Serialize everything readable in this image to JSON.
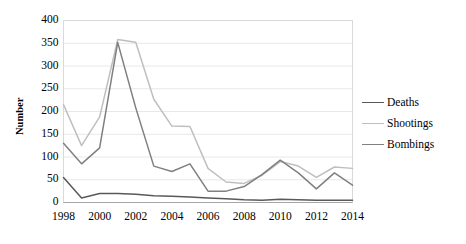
{
  "chart_data": {
    "type": "line",
    "title": "",
    "xlabel": "",
    "ylabel": "Number",
    "ylim": [
      0,
      400
    ],
    "ytick_step": 50,
    "yticks": [
      "400",
      "350",
      "300",
      "250",
      "200",
      "150",
      "100",
      "50",
      "0"
    ],
    "xticks": [
      "1998",
      "2000",
      "2002",
      "2004",
      "2006",
      "2008",
      "2010",
      "2012",
      "2014"
    ],
    "x": [
      1998,
      1999,
      2000,
      2001,
      2002,
      2003,
      2004,
      2005,
      2006,
      2007,
      2008,
      2009,
      2010,
      2011,
      2012,
      2013,
      2014
    ],
    "grid": "horizontal",
    "legend_position": "right",
    "series": [
      {
        "name": "Deaths",
        "color": "#595959",
        "values": [
          55,
          10,
          20,
          20,
          18,
          15,
          14,
          12,
          10,
          8,
          6,
          5,
          7,
          6,
          5,
          5,
          5
        ]
      },
      {
        "name": "Shootings",
        "color": "#bfbfbf",
        "values": [
          215,
          125,
          188,
          358,
          352,
          227,
          168,
          167,
          75,
          45,
          42,
          60,
          90,
          80,
          55,
          78,
          75
        ]
      },
      {
        "name": "Bombings",
        "color": "#808080",
        "values": [
          130,
          85,
          120,
          352,
          208,
          80,
          68,
          85,
          25,
          25,
          35,
          62,
          93,
          65,
          30,
          65,
          38
        ]
      }
    ]
  },
  "legend": {
    "items": [
      {
        "label": "Deaths",
        "color": "#595959"
      },
      {
        "label": "Shootings",
        "color": "#bfbfbf"
      },
      {
        "label": "Bombings",
        "color": "#808080"
      }
    ]
  },
  "plot": {
    "border_color": "#d9d9d9",
    "grid_color": "#e8e8e8",
    "axis_color": "#a6a6a6",
    "background": "#ffffff"
  }
}
